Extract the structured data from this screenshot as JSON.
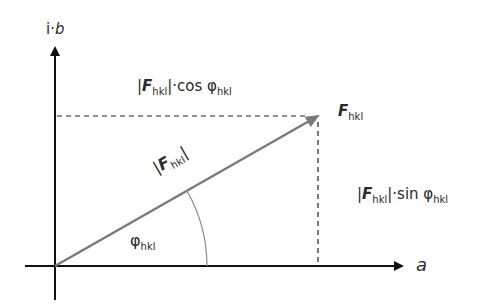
{
  "diagram": {
    "axes": {
      "x_label": "a",
      "y_label_prefix": "i·",
      "y_label_var": "b"
    },
    "vector": {
      "symbol": "F",
      "subscript": "hkl",
      "magnitude_label": {
        "bar_left": "|",
        "symbol": "F",
        "subscript": "hkl",
        "bar_right": "|"
      }
    },
    "angle": {
      "symbol": "φ",
      "subscript": "hkl"
    },
    "projections": {
      "cos": {
        "bar_left": "|",
        "symbol": "F",
        "subscript": "hkl",
        "bar_right": "|",
        "op": "·cos ",
        "angle": "φ",
        "angle_sub": "hkl"
      },
      "sin": {
        "bar_left": "|",
        "symbol": "F",
        "subscript": "hkl",
        "bar_right": "|",
        "op": "·sin ",
        "angle": "φ",
        "angle_sub": "hkl"
      }
    },
    "colors": {
      "axis": "#111111",
      "vector": "#7a7a7a",
      "dashed": "#222222",
      "arc": "#8a8a8a",
      "text": "#2a2a2a"
    }
  }
}
